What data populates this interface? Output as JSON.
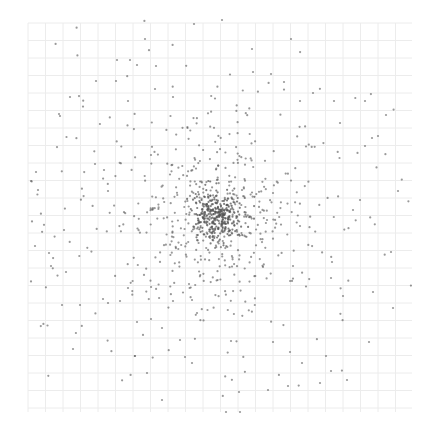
{
  "chart_data": {
    "type": "scatter",
    "title": "",
    "xlabel": "",
    "ylabel": "",
    "legend": null,
    "grid": true,
    "grid_color": "#ececec",
    "point_color": "#555555",
    "background": "#ffffff",
    "plot_area_px": {
      "x0": 28,
      "y0": 23,
      "x1": 412,
      "y1": 412
    },
    "grid_cell_px": 17.5,
    "center_px": [
      217,
      215
    ],
    "distribution": "radially concentrated cloud: dense core + sparse halo",
    "components": [
      {
        "name": "core",
        "count": 320,
        "sigma_px": 12
      },
      {
        "name": "mid",
        "count": 380,
        "sigma_px": 45
      },
      {
        "name": "halo",
        "count": 260,
        "sigma_px": 115
      }
    ],
    "seed": 7,
    "sample_outer_points_px": [
      [
        194,
        24
      ],
      [
        222,
        20
      ],
      [
        145,
        39
      ],
      [
        117,
        60
      ],
      [
        130,
        60
      ],
      [
        137,
        65
      ],
      [
        156,
        66
      ],
      [
        96,
        81
      ],
      [
        116,
        81
      ],
      [
        155,
        89
      ],
      [
        173,
        97
      ],
      [
        128,
        101
      ],
      [
        70,
        97
      ],
      [
        60,
        116
      ],
      [
        59,
        114
      ],
      [
        36,
        172
      ],
      [
        31,
        181
      ],
      [
        38,
        190
      ],
      [
        104,
        170
      ],
      [
        108,
        191
      ],
      [
        95,
        164
      ],
      [
        291,
        39
      ],
      [
        252,
        49
      ],
      [
        253,
        72
      ],
      [
        271,
        74
      ],
      [
        284,
        82
      ],
      [
        300,
        101
      ],
      [
        334,
        101
      ],
      [
        313,
        93
      ],
      [
        365,
        101
      ],
      [
        386,
        115
      ],
      [
        340,
        123
      ],
      [
        372,
        138
      ],
      [
        378,
        136
      ],
      [
        398,
        191
      ],
      [
        360,
        200
      ],
      [
        353,
        210
      ],
      [
        267,
        220
      ],
      [
        300,
        226
      ],
      [
        332,
        262
      ],
      [
        331,
        278
      ],
      [
        343,
        296
      ],
      [
        393,
        308
      ],
      [
        373,
        292
      ],
      [
        391,
        252
      ],
      [
        369,
        342
      ],
      [
        302,
        363
      ],
      [
        326,
        356
      ],
      [
        331,
        371
      ],
      [
        320,
        383
      ],
      [
        347,
        380
      ],
      [
        288,
        386
      ],
      [
        240,
        412
      ],
      [
        239,
        392
      ],
      [
        268,
        390
      ],
      [
        290,
        352
      ],
      [
        273,
        342
      ],
      [
        231,
        341
      ],
      [
        293,
        266
      ],
      [
        162,
        328
      ],
      [
        180,
        340
      ],
      [
        192,
        300
      ],
      [
        197,
        313
      ],
      [
        162,
        400
      ],
      [
        147,
        373
      ],
      [
        135,
        356
      ],
      [
        185,
        357
      ],
      [
        192,
        363
      ],
      [
        226,
        412
      ],
      [
        35,
        246
      ],
      [
        49,
        253
      ],
      [
        66,
        272
      ],
      [
        80,
        305
      ],
      [
        62,
        305
      ],
      [
        51,
        266
      ],
      [
        73,
        349
      ],
      [
        103,
        299
      ],
      [
        108,
        303
      ],
      [
        120,
        301
      ],
      [
        137,
        322
      ],
      [
        128,
        288
      ],
      [
        151,
        319
      ],
      [
        189,
        284
      ],
      [
        64,
        230
      ]
    ]
  }
}
